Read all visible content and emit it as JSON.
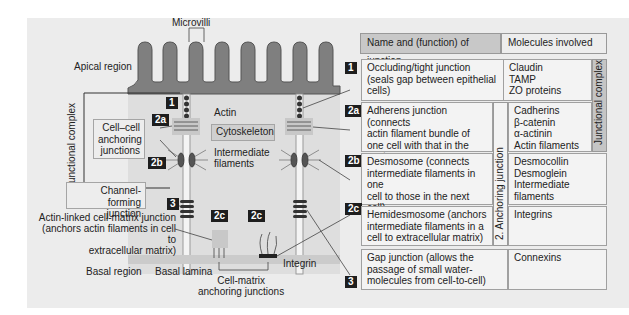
{
  "diagram": {
    "labels": {
      "microvilli": "Microvilli",
      "apical_region": "Apical region",
      "junctional_complex_left": "Junctional complex",
      "actin": "Actin",
      "cytoskeleton": "Cytoskeleton",
      "cell_cell_anchoring": "Cell–cell\nanchoring\njunctions",
      "intermediate_filaments": "Intermediate\nfilaments",
      "channel_forming": "Channel-forming\njunction",
      "actin_linked": "Actin-linked cell-matrix junction\n(anchors actin filaments in cell to\nextracellular matrix)",
      "basal_region": "Basal region",
      "basal_lamina": "Basal lamina",
      "cell_matrix_anchoring": "Cell-matrix\nanchoring junctions",
      "integrin": "Integrin"
    },
    "badges": {
      "b1": "1",
      "b2a": "2a",
      "b2b": "2b",
      "b3": "3",
      "b2c_left": "2c",
      "b2c_right": "2c"
    }
  },
  "table": {
    "header": {
      "name_col": "Name and (function) of junction",
      "molecules_col": "Molecules involved"
    },
    "side_labels": {
      "anchoring": "2. Anchoring junction",
      "junctional_complex": "Junctional complex"
    },
    "rows": [
      {
        "badge": "1",
        "name": "Occluding/tight junction\n(seals gap between epithelial\ncells)",
        "molecules": "Claudin\nTAMP\nZO proteins"
      },
      {
        "badge": "2a",
        "name": "Adherens junction (connects\nactin filament bundle of\none cell with that in the next\ncell)",
        "molecules": "Cadherins\nβ-catenin\nα-actinin\nActin filaments"
      },
      {
        "badge": "2b",
        "name": "Desmosome (connects\nintermediate filaments in one\ncell to those in the next cell)",
        "molecules": "Desmocollin\nDesmoglein\nIntermediate\nfilaments"
      },
      {
        "badge": "2c",
        "name": "Hemidesmosome (anchors\nintermediate filaments in a\ncell to extracellular matrix)",
        "molecules": "Integrins"
      },
      {
        "badge": "3",
        "name": "Gap junction (allows the\npassage of small water-\nmolecules from cell-to-cell)",
        "molecules": "Connexins"
      }
    ]
  }
}
